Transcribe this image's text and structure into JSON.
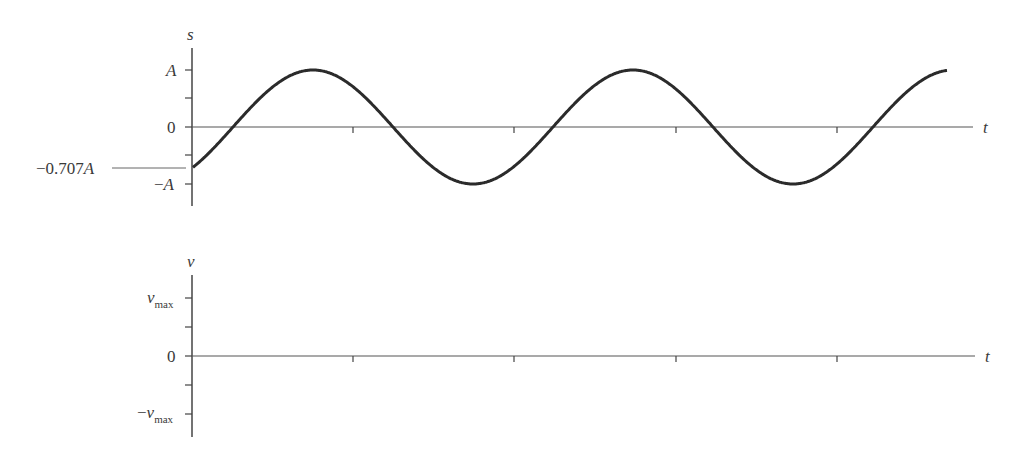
{
  "chart_data": [
    {
      "type": "line",
      "title": "",
      "ylabel": "s",
      "xlabel": "t",
      "y_tick_labels": [
        "A",
        "0",
        "-A"
      ],
      "annotation": "−0.707A",
      "annotation_value": -0.707,
      "function": "s(t) = A sin(2πt/T − π/4)",
      "period_px": 320,
      "x": [
        0,
        0.125,
        0.25,
        0.375,
        0.5,
        0.625,
        0.75,
        0.875,
        1.0,
        1.125,
        1.25,
        1.375,
        1.5,
        1.625,
        1.75,
        1.875,
        2.0,
        2.125,
        2.25,
        2.359
      ],
      "values": [
        -0.707,
        0,
        0.707,
        1,
        0.707,
        0,
        -0.707,
        -1,
        -0.707,
        0,
        0.707,
        1,
        0.707,
        0,
        -0.707,
        -1,
        -0.707,
        0,
        0.707,
        0.97
      ],
      "ylim": [
        -1,
        1
      ],
      "grid": false
    },
    {
      "type": "line",
      "title": "",
      "ylabel": "v",
      "xlabel": "t",
      "y_tick_labels": [
        "v_max",
        "0",
        "−v_max"
      ],
      "values": [],
      "note": "empty axes to be filled in",
      "grid": false
    }
  ],
  "top": {
    "ylabel": "s",
    "xlabel": "t",
    "tick_A": "A",
    "tick_zero": "0",
    "tick_negA_sign": "−",
    "tick_negA": "A",
    "annotation_num": "−0.707",
    "annotation_var": "A"
  },
  "bottom": {
    "ylabel": "v",
    "xlabel": "t",
    "tick_vmax_var": "v",
    "tick_vmax_sub": "max",
    "tick_zero": "0",
    "tick_negvmax_sign": "−",
    "tick_negvmax_var": "v",
    "tick_negvmax_sub": "max"
  }
}
